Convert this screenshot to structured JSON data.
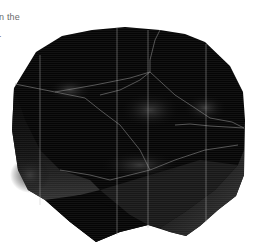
{
  "caption": {
    "line_1": "n the",
    "line_2": "."
  },
  "figure": {
    "colors": {
      "background": "#ffffff",
      "body": "#050505",
      "facet_highlight": "#3a3a3a",
      "edge_line": "#9a9a9a",
      "caption_text": "#6b6b6b"
    }
  }
}
